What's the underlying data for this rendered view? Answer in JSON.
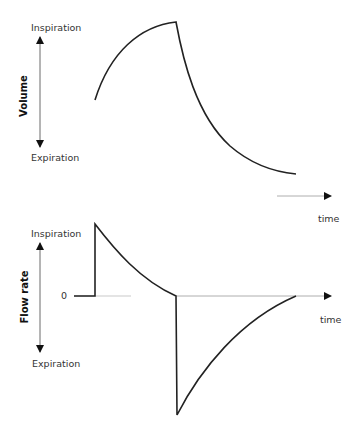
{
  "panels": [
    {
      "name": "volume",
      "axis_title": "Volume",
      "top_label": "Inspiration",
      "bottom_label": "Expiration",
      "time_label": "time"
    },
    {
      "name": "flow-rate",
      "axis_title": "Flow rate",
      "top_label": "Inspiration",
      "bottom_label": "Expiration",
      "zero_label": "0",
      "time_label": "time"
    }
  ],
  "colors": {
    "line": "#222222",
    "axis": "#999999",
    "text": "#333333"
  }
}
